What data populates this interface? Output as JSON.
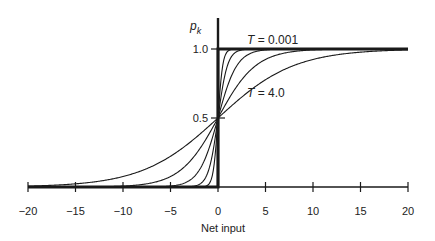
{
  "chart_data": {
    "type": "line",
    "title": "",
    "xlabel": "Net input",
    "ylabel": "p_k",
    "ylabel_main": "p",
    "ylabel_sub": "k",
    "xlim": [
      -20,
      20
    ],
    "ylim": [
      0,
      1
    ],
    "x_ticks": [
      -20,
      -15,
      -10,
      -5,
      0,
      5,
      10,
      15,
      20
    ],
    "x_tick_labels": [
      "−20",
      "−15",
      "−10",
      "−5",
      "0",
      "5",
      "10",
      "15",
      "20"
    ],
    "y_ticks": [
      0.5,
      1.0
    ],
    "y_tick_labels": [
      "0.5",
      "1.0"
    ],
    "grid": false,
    "legend": "none",
    "function": "p_k = 1 / (1 + exp(-x / T))",
    "series": [
      {
        "name": "T = 0.001",
        "T": 0.001,
        "style": "thick"
      },
      {
        "name": "T = 0.25",
        "T": 0.25,
        "style": "thin"
      },
      {
        "name": "T = 0.5",
        "T": 0.5,
        "style": "thin"
      },
      {
        "name": "T = 1.0",
        "T": 1.0,
        "style": "thin"
      },
      {
        "name": "T = 2.0",
        "T": 2.0,
        "style": "thin"
      },
      {
        "name": "T = 4.0",
        "T": 4.0,
        "style": "thin"
      }
    ],
    "annotations": [
      {
        "text_italic": "T",
        "text": " = 0.001",
        "near": "top step curve"
      },
      {
        "text_italic": "T",
        "text": " = 4.0",
        "near": "lowest right curve"
      }
    ]
  }
}
